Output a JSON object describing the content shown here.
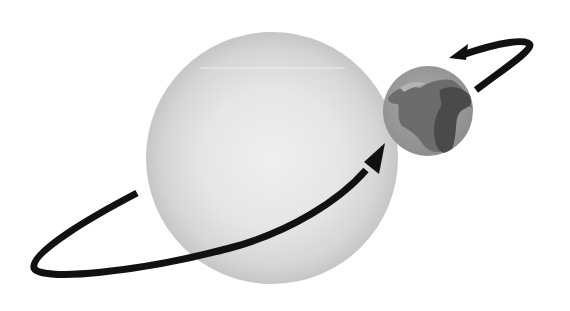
{
  "diagram": {
    "kind": "orbit-illustration",
    "elements": [
      {
        "id": "sun",
        "label": "Sun",
        "cx": 272,
        "cy": 158,
        "r": 126
      },
      {
        "id": "earth",
        "label": "Earth",
        "cx": 428,
        "cy": 111,
        "r": 45
      },
      {
        "id": "orbit-front",
        "label": "orbit path (front, arrow toward Earth)"
      },
      {
        "id": "orbit-back",
        "label": "orbit path (back, arrow pointing left)"
      }
    ],
    "colors": {
      "background": "#ffffff",
      "sun_edge": "#c8c8c8",
      "sun_center": "#ececec",
      "earth_ocean": "#9c9c9c",
      "earth_land_mid": "#6e6e6e",
      "earth_land_dark": "#4a4a4a",
      "orbit": "#111111"
    }
  }
}
